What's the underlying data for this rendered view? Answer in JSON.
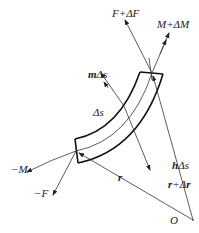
{
  "figure": {
    "labels": {
      "f_plus_df": "F+ΔF",
      "m_plus_dm": "M+ΔM",
      "m_ds_bold": "m",
      "m_ds_rest": "Δs",
      "delta_s": "Δs",
      "neg_m": "−M",
      "neg_f": "−F",
      "h_ds_bold": "h",
      "h_ds_rest": "Δs",
      "r": "r",
      "r_plus_dr_bold1": "r",
      "r_plus_dr_mid": "+Δ",
      "r_plus_dr_bold2": "r",
      "origin": "O"
    },
    "colors": {
      "stroke": "#111111",
      "thin": "#333333",
      "background": "#ffffff"
    }
  }
}
